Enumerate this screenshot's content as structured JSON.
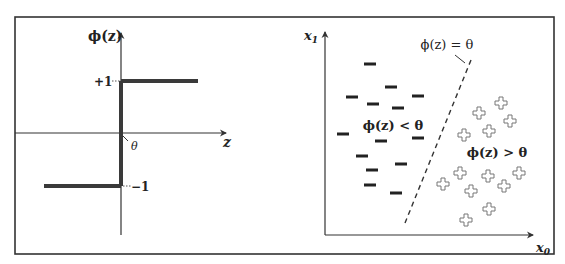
{
  "figure": {
    "frame": {
      "x": 15,
      "y": 17,
      "width": 539,
      "height": 237,
      "stroke": "#333333"
    },
    "colors": {
      "ink": "#222222",
      "axis": "#333333",
      "step": "#3a3a3a",
      "plus_stroke": "#777777",
      "minus": "#222222"
    }
  },
  "left_plot": {
    "title": "Unit step (threshold) function",
    "y_label": "ϕ(z)",
    "x_label": "z",
    "theta_label": "θ",
    "plus_one_label": "+1",
    "minus_one_label": "−1",
    "axes": {
      "origin": [
        121,
        133
      ],
      "x_axis": {
        "x1": 15,
        "x2": 226,
        "y": 133
      },
      "y_axis": {
        "x": 121,
        "y1": 33,
        "y2": 235
      }
    },
    "step": {
      "upper": {
        "x1": 121,
        "x2": 198,
        "y": 81
      },
      "lower": {
        "x1": 44,
        "x2": 121,
        "y": 186
      },
      "vertical": {
        "x": 121,
        "y1": 81,
        "y2": 186
      }
    },
    "positions": {
      "y_label": [
        88,
        41
      ],
      "x_label": [
        223,
        147
      ],
      "theta_label": [
        131,
        150
      ],
      "plus_one": [
        94,
        86
      ],
      "minus_one": [
        131,
        191
      ]
    }
  },
  "right_plot": {
    "x_label": "x",
    "x_sub": "0",
    "y_label": "x",
    "y_sub": "1",
    "boundary_label": "ϕ(z) = θ",
    "negative_region_label": "ϕ(z) < θ",
    "positive_region_label": "ϕ(z) > θ",
    "axes": {
      "x_axis": {
        "x1": 325,
        "x2": 533,
        "y": 235
      },
      "y_axis": {
        "x": 325,
        "y1": 32,
        "y2": 235
      }
    },
    "decision_boundary": {
      "x1": 471,
      "y1": 60,
      "x2": 405,
      "y2": 223
    },
    "leader_line": {
      "x1": 455,
      "y1": 55,
      "x2": 465,
      "y2": 63
    },
    "positions": {
      "x_label": [
        536,
        252
      ],
      "y_label": [
        304,
        40
      ],
      "boundary_label": [
        447,
        49
      ],
      "negative_label": [
        393,
        130
      ],
      "positive_label": [
        497,
        157
      ]
    },
    "minus_points": [
      [
        370,
        64
      ],
      [
        391,
        87
      ],
      [
        352,
        97
      ],
      [
        418,
        96
      ],
      [
        373,
        104
      ],
      [
        398,
        108
      ],
      [
        343,
        134
      ],
      [
        381,
        141
      ],
      [
        418,
        138
      ],
      [
        362,
        156
      ],
      [
        401,
        164
      ],
      [
        372,
        170
      ],
      [
        370,
        185
      ],
      [
        396,
        193
      ]
    ],
    "plus_points": [
      [
        501,
        103
      ],
      [
        479,
        113
      ],
      [
        510,
        121
      ],
      [
        489,
        131
      ],
      [
        464,
        135
      ],
      [
        460,
        173
      ],
      [
        488,
        176
      ],
      [
        519,
        173
      ],
      [
        443,
        184
      ],
      [
        471,
        191
      ],
      [
        504,
        186
      ],
      [
        489,
        209
      ],
      [
        466,
        220
      ]
    ]
  }
}
